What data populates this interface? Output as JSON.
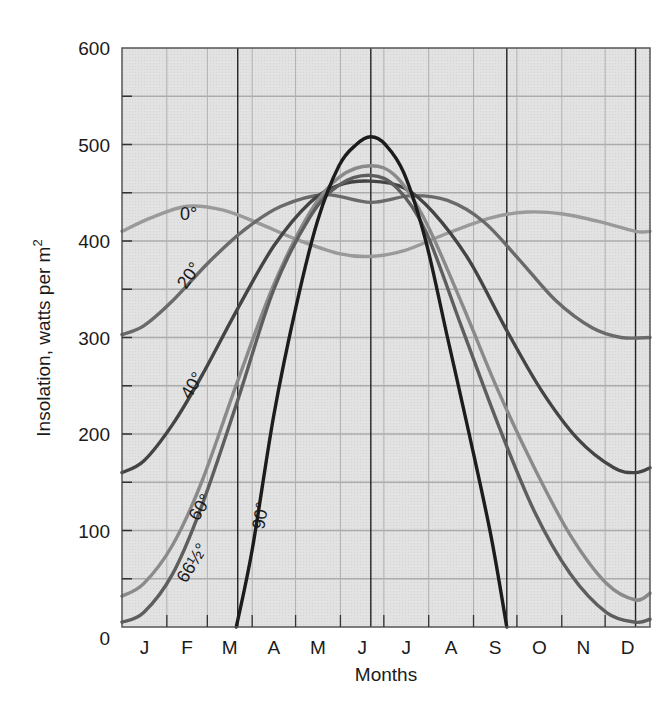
{
  "chart_data": {
    "type": "line",
    "title": "",
    "xlabel": "Months",
    "ylabel": "Insolation, watts per m",
    "ylabel_superscript": "2",
    "ylim": [
      0,
      600
    ],
    "yticks": [
      0,
      100,
      200,
      300,
      400,
      500,
      600
    ],
    "minor_yticks": [
      50,
      150,
      250,
      350,
      450,
      550
    ],
    "categories": [
      "J",
      "F",
      "M",
      "A",
      "M",
      "J",
      "J",
      "A",
      "S",
      "O",
      "N",
      "D"
    ],
    "grid": true,
    "legend": "inline curve labels",
    "reference_lines": [
      {
        "label": "March equinox",
        "day": 80
      },
      {
        "label": "June solstice",
        "day": 172
      },
      {
        "label": "September equinox",
        "day": 266
      },
      {
        "label": "December solstice",
        "day": 355
      }
    ],
    "x_unit": "day of year",
    "series": [
      {
        "name": "0°",
        "label": "0°",
        "color": "#9a9a9a",
        "points": [
          [
            0,
            410
          ],
          [
            20,
            424
          ],
          [
            45,
            436
          ],
          [
            70,
            432
          ],
          [
            95,
            418
          ],
          [
            120,
            402
          ],
          [
            150,
            387
          ],
          [
            172,
            384
          ],
          [
            195,
            390
          ],
          [
            225,
            408
          ],
          [
            255,
            424
          ],
          [
            280,
            430
          ],
          [
            305,
            428
          ],
          [
            330,
            420
          ],
          [
            355,
            410
          ],
          [
            365,
            410
          ]
        ]
      },
      {
        "name": "20°",
        "label": "20°",
        "color": "#6a6a6a",
        "points": [
          [
            0,
            303
          ],
          [
            15,
            312
          ],
          [
            35,
            338
          ],
          [
            60,
            378
          ],
          [
            85,
            412
          ],
          [
            110,
            436
          ],
          [
            140,
            448
          ],
          [
            172,
            440
          ],
          [
            200,
            447
          ],
          [
            225,
            442
          ],
          [
            250,
            420
          ],
          [
            275,
            380
          ],
          [
            300,
            338
          ],
          [
            325,
            310
          ],
          [
            345,
            300
          ],
          [
            365,
            300
          ]
        ]
      },
      {
        "name": "40°",
        "label": "40°",
        "color": "#444444",
        "points": [
          [
            0,
            160
          ],
          [
            15,
            172
          ],
          [
            35,
            210
          ],
          [
            55,
            260
          ],
          [
            80,
            330
          ],
          [
            105,
            395
          ],
          [
            130,
            440
          ],
          [
            150,
            458
          ],
          [
            172,
            462
          ],
          [
            195,
            455
          ],
          [
            215,
            430
          ],
          [
            240,
            380
          ],
          [
            265,
            310
          ],
          [
            290,
            245
          ],
          [
            315,
            195
          ],
          [
            340,
            165
          ],
          [
            355,
            160
          ],
          [
            365,
            165
          ]
        ]
      },
      {
        "name": "60°",
        "label": "60°",
        "color": "#8a8a8a",
        "points": [
          [
            0,
            32
          ],
          [
            15,
            45
          ],
          [
            35,
            85
          ],
          [
            55,
            150
          ],
          [
            80,
            255
          ],
          [
            105,
            355
          ],
          [
            130,
            430
          ],
          [
            150,
            466
          ],
          [
            172,
            478
          ],
          [
            190,
            466
          ],
          [
            210,
            420
          ],
          [
            235,
            335
          ],
          [
            260,
            245
          ],
          [
            285,
            165
          ],
          [
            310,
            95
          ],
          [
            335,
            45
          ],
          [
            355,
            28
          ],
          [
            365,
            35
          ]
        ]
      },
      {
        "name": "66½°",
        "label": "66½°",
        "color": "#5e5e5e",
        "points": [
          [
            0,
            5
          ],
          [
            15,
            15
          ],
          [
            35,
            55
          ],
          [
            55,
            125
          ],
          [
            80,
            235
          ],
          [
            105,
            350
          ],
          [
            130,
            425
          ],
          [
            150,
            458
          ],
          [
            172,
            468
          ],
          [
            190,
            455
          ],
          [
            210,
            410
          ],
          [
            235,
            310
          ],
          [
            260,
            210
          ],
          [
            285,
            120
          ],
          [
            310,
            55
          ],
          [
            335,
            15
          ],
          [
            355,
            5
          ],
          [
            365,
            8
          ]
        ]
      },
      {
        "name": "90°",
        "label": "90°",
        "color": "#1c1c1c",
        "points": [
          [
            79,
            0
          ],
          [
            90,
            80
          ],
          [
            105,
            220
          ],
          [
            120,
            330
          ],
          [
            135,
            420
          ],
          [
            150,
            478
          ],
          [
            162,
            500
          ],
          [
            172,
            508
          ],
          [
            182,
            500
          ],
          [
            195,
            470
          ],
          [
            210,
            400
          ],
          [
            225,
            300
          ],
          [
            240,
            200
          ],
          [
            255,
            95
          ],
          [
            266,
            0
          ]
        ]
      }
    ]
  },
  "labels": {
    "y_axis_title": "Insolation, watts per m",
    "y_axis_sup": "2",
    "x_axis_title": "Months",
    "curve_0": "0°",
    "curve_20": "20°",
    "curve_40": "40°",
    "curve_60": "60°",
    "curve_665": "66½°",
    "curve_90": "90°"
  }
}
